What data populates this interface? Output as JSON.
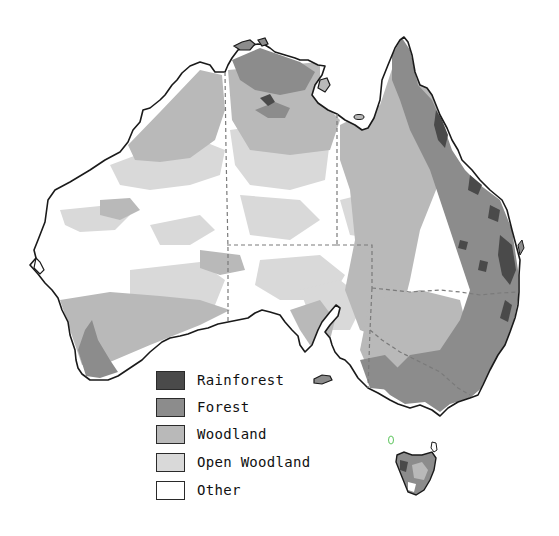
{
  "map": {
    "subject": "Australia vegetation cover",
    "colors": {
      "rainforest": "#4a4a4a",
      "forest": "#8c8c8c",
      "woodland": "#b9b9b9",
      "open_woodland": "#d9d9d9",
      "other": "#ffffff",
      "outline": "#1a1a1a",
      "border": "#7a7a7a"
    }
  },
  "legend": {
    "items": [
      {
        "label": "Rainforest",
        "color": "#4a4a4a"
      },
      {
        "label": "Forest",
        "color": "#8c8c8c"
      },
      {
        "label": "Woodland",
        "color": "#b9b9b9"
      },
      {
        "label": "Open Woodland",
        "color": "#d9d9d9"
      },
      {
        "label": "Other",
        "color": "#ffffff"
      }
    ]
  }
}
